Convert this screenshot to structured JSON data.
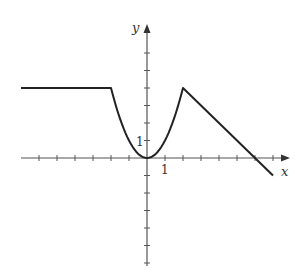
{
  "chart_data": {
    "type": "line",
    "title": "",
    "xlabel": "x",
    "ylabel": "y",
    "xlim": [
      -7,
      8
    ],
    "ylim": [
      -6,
      7
    ],
    "grid": false,
    "legend": null,
    "tick_labels": {
      "x": [
        "1"
      ],
      "y": [
        "1"
      ]
    },
    "x_ticks": [
      -6,
      -5,
      -4,
      -3,
      -2,
      -1,
      1,
      2,
      3,
      4,
      5,
      6,
      7
    ],
    "y_ticks": [
      -6,
      -5,
      -4,
      -3,
      -2,
      -1,
      1,
      2,
      3,
      4,
      5,
      6
    ],
    "series": [
      {
        "name": "f",
        "segments": [
          {
            "kind": "line",
            "points": [
              [
                -7,
                4
              ],
              [
                -2,
                4
              ]
            ]
          },
          {
            "kind": "parabola",
            "formula": "y = x^2",
            "domain": [
              -2,
              2
            ],
            "points": [
              [
                -2,
                4
              ],
              [
                -1,
                1
              ],
              [
                0,
                0
              ],
              [
                1,
                1
              ],
              [
                2,
                4
              ]
            ]
          },
          {
            "kind": "line",
            "points": [
              [
                2,
                4
              ],
              [
                7,
                -1
              ]
            ]
          }
        ]
      }
    ]
  },
  "labels": {
    "x_axis": "x",
    "y_axis": "y",
    "x_unit": "1",
    "y_unit": "1"
  }
}
